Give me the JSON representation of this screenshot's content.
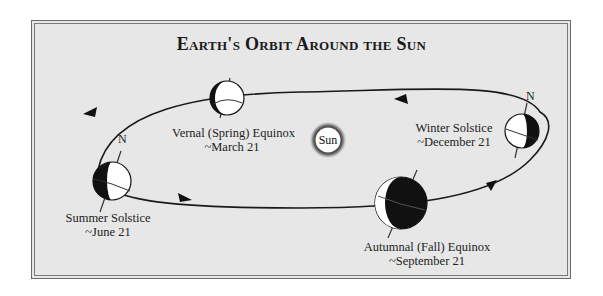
{
  "title": "Earth's Orbit Around the Sun",
  "sun": {
    "label": "Sun"
  },
  "north_label": "N",
  "positions": [
    {
      "name": "Vernal (Spring) Equinox",
      "date": "~March 21"
    },
    {
      "name": "Winter Solstice",
      "date": "~December 21"
    },
    {
      "name": "Summer Solstice",
      "date": "~June 21"
    },
    {
      "name": "Autumnal (Fall) Equinox",
      "date": "~September 21"
    }
  ],
  "colors": {
    "background": "#e7e7e7",
    "frame": "#6a6a6a",
    "ink": "#111111",
    "sun_fill": "#ffffff"
  }
}
